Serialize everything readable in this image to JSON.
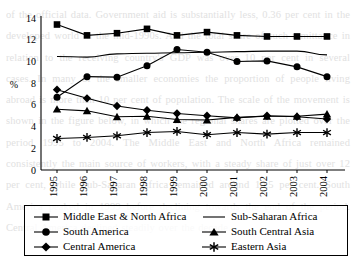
{
  "page": {
    "bleed_text": "of the official data. Government aid is substantially less, 0.36 per cent in the developed world in the mid-1990s. And the total share of such remittance in relation to the receiving country's GDP was over 10 per cent in several cases. In many of the smaller economies the proportion of people living abroad is more than 10 per cent of population. The scale of the movement is shown in the figure below, in which the regional shares are plotted over the period 1995 to 2004. The Middle East and North Africa remained consistently the main source of workers, with a steady share of just over 12 per cent, while Sub-Saharan Africa remained around 10.5 per cent. South America peaked in 1999 before declining towards the end of the period. Central America declined steadily over the decade."
  },
  "chart_data": {
    "type": "line",
    "title": "",
    "xlabel": "",
    "ylabel": "%",
    "ylim": [
      0,
      14
    ],
    "ytick_step": 2,
    "yticks": [
      "0",
      "2",
      "4",
      "6",
      "8",
      "10",
      "12",
      "14"
    ],
    "grid": false,
    "legend_position": "bottom",
    "categories": [
      "1995",
      "1996",
      "1997",
      "1998",
      "1999",
      "2000",
      "2001",
      "2002",
      "2003",
      "2004"
    ],
    "series": [
      {
        "name": "Middle East & North Africa",
        "marker": "square",
        "color": "#000000",
        "values": [
          13.4,
          12.4,
          12.6,
          13.0,
          12.4,
          12.7,
          12.4,
          12.3,
          12.3,
          12.3
        ]
      },
      {
        "name": "Sub-Saharan Africa",
        "marker": "none",
        "color": "#000000",
        "values": [
          10.45,
          10.4,
          10.7,
          10.75,
          10.8,
          10.85,
          10.9,
          10.95,
          10.95,
          10.6
        ]
      },
      {
        "name": "South America",
        "marker": "circle",
        "color": "#000000",
        "values": [
          6.7,
          8.6,
          8.55,
          9.6,
          11.1,
          10.85,
          10.0,
          10.05,
          9.5,
          8.6
        ]
      },
      {
        "name": "South Central Asia",
        "marker": "triangle",
        "color": "#000000",
        "values": [
          5.6,
          5.45,
          4.9,
          4.95,
          4.65,
          4.6,
          4.85,
          4.95,
          4.95,
          5.15
        ]
      },
      {
        "name": "Central America",
        "marker": "diamond",
        "color": "#000000",
        "values": [
          7.4,
          6.6,
          5.9,
          5.5,
          5.2,
          5.0,
          4.8,
          5.0,
          4.9,
          4.7
        ]
      },
      {
        "name": "Eastern Asia",
        "marker": "asterisk",
        "color": "#000000",
        "values": [
          2.9,
          3.0,
          3.15,
          3.45,
          3.55,
          3.25,
          3.45,
          3.3,
          3.45,
          3.45
        ]
      }
    ]
  },
  "legend": {
    "left_column": [
      {
        "label": "Middle East & North Africa",
        "marker": "square"
      },
      {
        "label": "South America",
        "marker": "circle"
      },
      {
        "label": "Central America",
        "marker": "diamond"
      }
    ],
    "right_column": [
      {
        "label": "Sub-Saharan Africa",
        "marker": "none"
      },
      {
        "label": "South Central Asia",
        "marker": "triangle"
      },
      {
        "label": "Eastern Asia",
        "marker": "asterisk"
      }
    ]
  }
}
